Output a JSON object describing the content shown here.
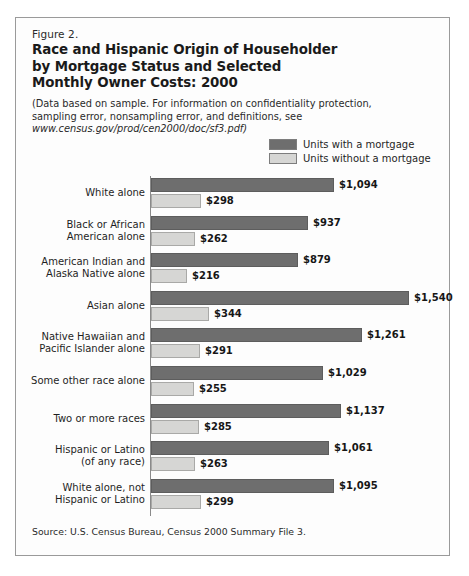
{
  "figure": {
    "number": "Figure 2.",
    "title_line1": "Race and Hispanic Origin of Householder",
    "title_line2": "by Mortgage Status and Selected",
    "title_line3": "Monthly Owner Costs:  2000",
    "note_line1": "(Data based on sample.  For information on confidentiality protection,",
    "note_line2": "sampling error, nonsampling error, and definitions, see",
    "note_line3": "www.census.gov/prod/cen2000/doc/sf3.pdf)",
    "source": "Source: U.S. Census Bureau, Census 2000 Summary File 3."
  },
  "legend": {
    "items": [
      {
        "label": "Units with a mortgage",
        "color": "#6e6e6e"
      },
      {
        "label": "Units without a mortgage",
        "color": "#d6d6d4"
      }
    ]
  },
  "chart_data": {
    "type": "bar",
    "orientation": "horizontal",
    "title": "Race and Hispanic Origin of Householder by Mortgage Status and Selected Monthly Owner Costs: 2000",
    "xlabel": "",
    "ylabel": "",
    "grid": false,
    "legend_position": "top-right",
    "xlim": [
      0,
      1540
    ],
    "categories": [
      "White alone",
      "Black or African American alone",
      "American Indian and Alaska Native alone",
      "Asian alone",
      "Native Hawaiian and Pacific Islander alone",
      "Some other race alone",
      "Two or more races",
      "Hispanic or Latino (of any race)",
      "White alone, not Hispanic or Latino"
    ],
    "category_lines": [
      [
        "White alone"
      ],
      [
        "Black or African",
        "American alone"
      ],
      [
        "American Indian and",
        "Alaska Native alone"
      ],
      [
        "Asian alone"
      ],
      [
        "Native Hawaiian and",
        "Pacific Islander alone"
      ],
      [
        "Some other race alone"
      ],
      [
        "Two or more races"
      ],
      [
        "Hispanic or Latino",
        "(of any race)"
      ],
      [
        "White alone, not",
        "Hispanic or Latino"
      ]
    ],
    "series": [
      {
        "name": "Units with a mortgage",
        "color": "#6e6e6e",
        "values": [
          1094,
          937,
          879,
          1540,
          1261,
          1029,
          1137,
          1061,
          1095
        ],
        "labels": [
          "$1,094",
          "$937",
          "$879",
          "$1,540",
          "$1,261",
          "$1,029",
          "$1,137",
          "$1,061",
          "$1,095"
        ]
      },
      {
        "name": "Units without a mortgage",
        "color": "#d6d6d4",
        "values": [
          298,
          262,
          216,
          344,
          291,
          255,
          285,
          263,
          299
        ],
        "labels": [
          "$298",
          "$262",
          "$216",
          "$344",
          "$291",
          "$255",
          "$285",
          "$263",
          "$299"
        ]
      }
    ]
  }
}
